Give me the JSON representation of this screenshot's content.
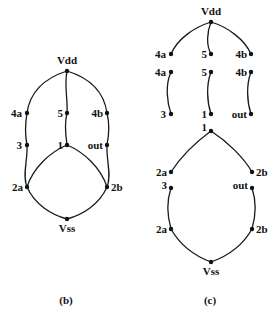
{
  "figure_b": {
    "caption": "(b)",
    "nodes": {
      "vdd": "Vdd",
      "n4a": "4a",
      "n5": "5",
      "n4b": "4b",
      "n3": "3",
      "n1": "1",
      "out": "out",
      "n2a": "2a",
      "n2b": "2b",
      "vss": "Vss"
    }
  },
  "figure_c": {
    "caption": "(c)",
    "top": {
      "vdd": "Vdd",
      "n4a": "4a",
      "n5": "5",
      "n4b": "4b"
    },
    "middle": {
      "n4a": "4a",
      "n5": "5",
      "n4b": "4b",
      "n3": "3",
      "n1": "1",
      "out": "out"
    },
    "upper_oval": {
      "n1": "1",
      "n2a": "2a",
      "n2b": "2b"
    },
    "lower_oval": {
      "n3": "3",
      "out": "out",
      "n2a": "2a",
      "n2b": "2b",
      "vss": "Vss"
    }
  }
}
